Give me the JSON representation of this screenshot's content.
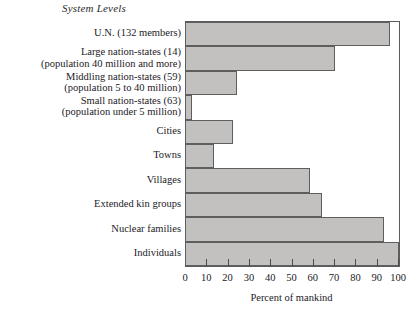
{
  "chart_data": {
    "type": "bar",
    "orientation": "horizontal",
    "title": "System Levels",
    "xlabel": "Percent of mankind",
    "ylabel": "",
    "xlim": [
      0,
      100
    ],
    "xticks": [
      0,
      10,
      20,
      30,
      40,
      50,
      60,
      70,
      80,
      90,
      100
    ],
    "grid": false,
    "legend": null,
    "categories": [
      "U.N. (132 members)",
      "Large nation-states (14) (population 40 million and more)",
      "Middling nation-states (59) (population 5 to 40 million)",
      "Small nation-states (63) (population under 5 million)",
      "Cities",
      "Towns",
      "Villages",
      "Extended kin groups",
      "Nuclear families",
      "Individuals"
    ],
    "values": [
      96,
      70,
      24,
      3,
      22,
      13,
      58,
      64,
      93,
      100
    ]
  },
  "rows": [
    {
      "line1": "U.N. (132 members)",
      "line2": "",
      "value": 96
    },
    {
      "line1": "Large nation-states (14)",
      "line2": "(population 40 million and more)",
      "value": 70
    },
    {
      "line1": "Middling nation-states (59)",
      "line2": "(population 5 to 40 million)",
      "value": 24
    },
    {
      "line1": "Small nation-states (63)",
      "line2": "(population under 5 million)",
      "value": 3
    },
    {
      "line1": "Cities",
      "line2": "",
      "value": 22
    },
    {
      "line1": "Towns",
      "line2": "",
      "value": 13
    },
    {
      "line1": "Villages",
      "line2": "",
      "value": 58
    },
    {
      "line1": "Extended kin groups",
      "line2": "",
      "value": 64
    },
    {
      "line1": "Nuclear families",
      "line2": "",
      "value": 93
    },
    {
      "line1": "Individuals",
      "line2": "",
      "value": 100
    }
  ],
  "ticklabels": [
    "0",
    "10",
    "20",
    "30",
    "40",
    "50",
    "60",
    "70",
    "80",
    "90",
    "100"
  ],
  "colors": {
    "bar_fill": "#c2c1bf",
    "bar_stroke": "#5e5e5e",
    "text": "#23211f",
    "background": "#ffffff"
  }
}
